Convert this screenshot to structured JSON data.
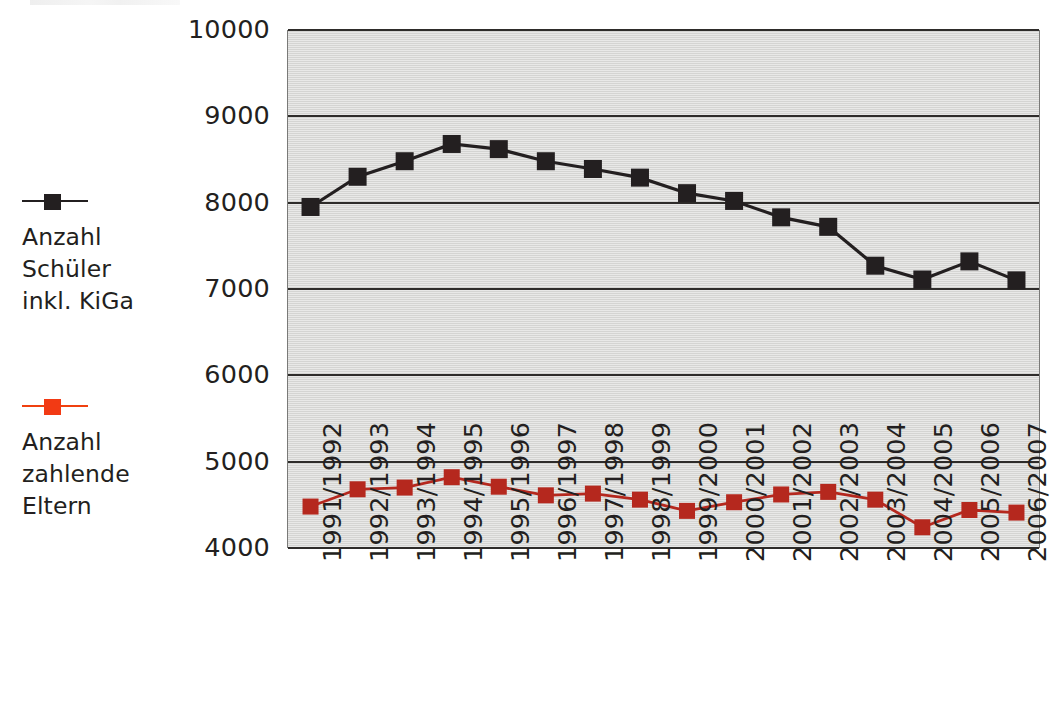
{
  "chart_data": {
    "type": "line",
    "title": "",
    "subtitle": "",
    "xlabel": "",
    "ylabel": "",
    "ylim": [
      4000,
      10000
    ],
    "ytick_step": 1000,
    "yticks": [
      10000,
      9000,
      8000,
      7000,
      6000,
      5000,
      4000
    ],
    "grid": true,
    "legend_position": "left",
    "plot_background": "#d9d9d7",
    "categories": [
      "1991/1992",
      "1992/1993",
      "1993/1994",
      "1994/1995",
      "1995/1996",
      "1996/1997",
      "1997/1998",
      "1998/1999",
      "1999/2000",
      "2000/2001",
      "2001/2002",
      "2002/2003",
      "2003/2004",
      "2004/2005",
      "2005/2006",
      "2006/2007"
    ],
    "series": [
      {
        "name": "Anzahl Schüler inkl. KiGa",
        "legend_label": "Anzahl\nSchüler\ninkl. KiGa",
        "color": "#231f20",
        "marker": "square",
        "values": [
          7950,
          8300,
          8480,
          8680,
          8620,
          8480,
          8390,
          8290,
          8110,
          8020,
          7830,
          7720,
          7270,
          7110,
          7320,
          7100
        ]
      },
      {
        "name": "Anzahl zahlende Eltern",
        "legend_label": "Anzahl\nzahlende\nEltern",
        "color": "#b5281e",
        "legend_color": "#f23a14",
        "marker": "square",
        "values": [
          4480,
          4680,
          4700,
          4820,
          4710,
          4610,
          4630,
          4560,
          4430,
          4530,
          4620,
          4650,
          4560,
          4240,
          4440,
          4410
        ]
      }
    ]
  }
}
